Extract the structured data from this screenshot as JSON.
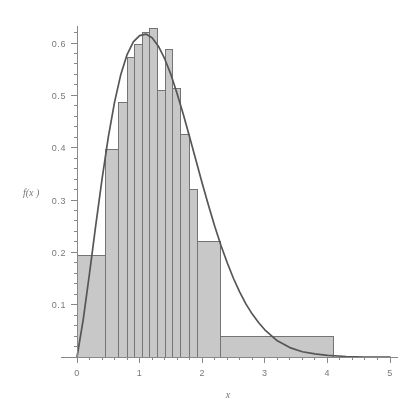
{
  "chart_data": {
    "type": "bar",
    "title": "",
    "subtitle": "",
    "xlabel": "x",
    "ylabel": "f(x )",
    "xlim": [
      0,
      5
    ],
    "ylim": [
      0,
      0.645
    ],
    "grid": false,
    "legend": null,
    "x_ticks": [
      "0",
      "1",
      "2",
      "3",
      "4",
      "5"
    ],
    "x_tick_values": [
      0,
      1,
      2,
      3,
      4,
      5
    ],
    "y_ticks": [
      "0.1",
      "0.2",
      "0.3",
      "0.4",
      "0.5",
      "0.6"
    ],
    "y_tick_values": [
      0.1,
      0.2,
      0.3,
      0.4,
      0.5,
      0.6
    ],
    "bar_fill_color": "#c4c4c4",
    "bar_edge_color": "#6a6a6a",
    "curve_color": "#4a4a4a",
    "axis_color": "#808080",
    "histogram_bins": [
      {
        "x0": 0.0,
        "x1": 0.45,
        "height": 0.193
      },
      {
        "x0": 0.45,
        "x1": 0.67,
        "height": 0.397
      },
      {
        "x0": 0.67,
        "x1": 0.8,
        "height": 0.487
      },
      {
        "x0": 0.8,
        "x1": 0.92,
        "height": 0.573
      },
      {
        "x0": 0.92,
        "x1": 1.04,
        "height": 0.597
      },
      {
        "x0": 1.04,
        "x1": 1.16,
        "height": 0.62
      },
      {
        "x0": 1.16,
        "x1": 1.29,
        "height": 0.628
      },
      {
        "x0": 1.29,
        "x1": 1.41,
        "height": 0.51
      },
      {
        "x0": 1.41,
        "x1": 1.53,
        "height": 0.587
      },
      {
        "x0": 1.53,
        "x1": 1.66,
        "height": 0.513
      },
      {
        "x0": 1.66,
        "x1": 1.8,
        "height": 0.425
      },
      {
        "x0": 1.8,
        "x1": 1.92,
        "height": 0.32
      },
      {
        "x0": 1.92,
        "x1": 2.3,
        "height": 0.22
      },
      {
        "x0": 2.3,
        "x1": 4.1,
        "height": 0.04
      }
    ],
    "curve": {
      "name": "fitted density",
      "description": "smooth unimodal density curve peaking near x = 1.1",
      "points": [
        {
          "x": 0.0,
          "y": 0.0
        },
        {
          "x": 0.1,
          "y": 0.072
        },
        {
          "x": 0.2,
          "y": 0.16
        },
        {
          "x": 0.3,
          "y": 0.252
        },
        {
          "x": 0.4,
          "y": 0.34
        },
        {
          "x": 0.5,
          "y": 0.42
        },
        {
          "x": 0.6,
          "y": 0.487
        },
        {
          "x": 0.7,
          "y": 0.54
        },
        {
          "x": 0.8,
          "y": 0.578
        },
        {
          "x": 0.9,
          "y": 0.602
        },
        {
          "x": 1.0,
          "y": 0.614
        },
        {
          "x": 1.1,
          "y": 0.617
        },
        {
          "x": 1.2,
          "y": 0.61
        },
        {
          "x": 1.3,
          "y": 0.594
        },
        {
          "x": 1.4,
          "y": 0.57
        },
        {
          "x": 1.5,
          "y": 0.54
        },
        {
          "x": 1.6,
          "y": 0.503
        },
        {
          "x": 1.7,
          "y": 0.463
        },
        {
          "x": 1.8,
          "y": 0.42
        },
        {
          "x": 1.9,
          "y": 0.376
        },
        {
          "x": 2.0,
          "y": 0.332
        },
        {
          "x": 2.1,
          "y": 0.29
        },
        {
          "x": 2.2,
          "y": 0.25
        },
        {
          "x": 2.3,
          "y": 0.213
        },
        {
          "x": 2.4,
          "y": 0.18
        },
        {
          "x": 2.5,
          "y": 0.15
        },
        {
          "x": 2.6,
          "y": 0.124
        },
        {
          "x": 2.7,
          "y": 0.101
        },
        {
          "x": 2.8,
          "y": 0.082
        },
        {
          "x": 2.9,
          "y": 0.066
        },
        {
          "x": 3.0,
          "y": 0.052
        },
        {
          "x": 3.2,
          "y": 0.031
        },
        {
          "x": 3.4,
          "y": 0.018
        },
        {
          "x": 3.6,
          "y": 0.01
        },
        {
          "x": 3.8,
          "y": 0.006
        },
        {
          "x": 4.0,
          "y": 0.003
        },
        {
          "x": 4.3,
          "y": 0.001
        },
        {
          "x": 4.6,
          "y": 0.0
        },
        {
          "x": 5.0,
          "y": 0.0
        }
      ]
    }
  }
}
